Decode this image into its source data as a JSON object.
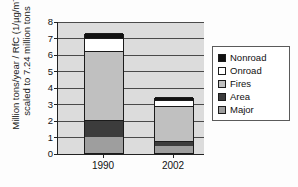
{
  "chart_data": {
    "type": "bar",
    "stacked": true,
    "title": "",
    "xlabel": "",
    "ylabel": "Million tons/year / RfC (1/µg/m⁻³) scaled to 7.24 million tons",
    "ylabel_line1": "Million tons/year / RfC (1/µg/m",
    "ylabel_line1_sup": "-3",
    "ylabel_line1_close": ")",
    "ylabel_line2": "scaled to 7.24  million tons",
    "categories": [
      "1990",
      "2002"
    ],
    "ylim": [
      0,
      8
    ],
    "yticks": [
      "0",
      "1",
      "2",
      "3",
      "4",
      "5",
      "6",
      "7",
      "8"
    ],
    "grid": true,
    "legend_position": "right",
    "series": [
      {
        "name": "Major",
        "color": "#9e9e9e",
        "values": [
          1.0,
          0.45
        ]
      },
      {
        "name": "Area",
        "color": "#3c3c3c",
        "values": [
          1.0,
          0.25
        ]
      },
      {
        "name": "Fires",
        "color": "#c0c0c0",
        "values": [
          4.2,
          2.15
        ]
      },
      {
        "name": "Onroad",
        "color": "#ffffff",
        "values": [
          0.75,
          0.35
        ]
      },
      {
        "name": "Nonroad",
        "color": "#111111",
        "values": [
          0.3,
          0.2
        ]
      }
    ],
    "totals": [
      7.25,
      3.4
    ],
    "legend_order": [
      "Nonroad",
      "Onroad",
      "Fires",
      "Area",
      "Major"
    ],
    "legend": [
      {
        "label": "Nonroad",
        "color": "#111111"
      },
      {
        "label": "Onroad",
        "color": "#ffffff"
      },
      {
        "label": "Fires",
        "color": "#c0c0c0"
      },
      {
        "label": "Area",
        "color": "#3c3c3c"
      },
      {
        "label": "Major",
        "color": "#9e9e9e"
      }
    ]
  }
}
